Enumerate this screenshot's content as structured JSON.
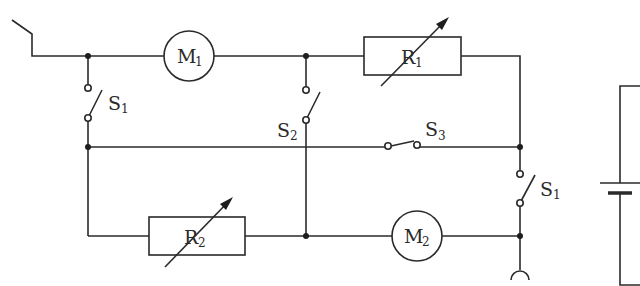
{
  "diagram": {
    "type": "circuit-schematic",
    "components": {
      "motor_1": {
        "letter": "M",
        "index": "1"
      },
      "motor_2": {
        "letter": "M",
        "index": "2"
      },
      "rheostat_1": {
        "letter": "R",
        "index": "1"
      },
      "rheostat_2": {
        "letter": "R",
        "index": "2"
      },
      "switch_1_top": {
        "letter": "S",
        "index": "1"
      },
      "switch_2": {
        "letter": "S",
        "index": "2"
      },
      "switch_3": {
        "letter": "S",
        "index": "3"
      },
      "switch_1_right": {
        "letter": "S",
        "index": "1"
      }
    },
    "colors": {
      "line": "#2a2a2a",
      "background": "#ffffff"
    }
  }
}
